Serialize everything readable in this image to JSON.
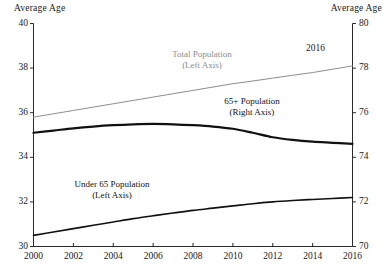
{
  "chart_data": {
    "type": "line",
    "title": "",
    "subtitle": "",
    "xlabel": "",
    "ylabel": "Average Age",
    "y2label": "Average Age",
    "grid": false,
    "legend_position": "inline-annotations",
    "x": [
      2000,
      2001,
      2002,
      2003,
      2004,
      2005,
      2006,
      2007,
      2008,
      2009,
      2010,
      2011,
      2012,
      2013,
      2014,
      2015,
      2016
    ],
    "xlim": [
      2000,
      2016
    ],
    "xticks": [
      2000,
      2002,
      2004,
      2006,
      2008,
      2010,
      2012,
      2014,
      2016
    ],
    "xticklabels": [
      "2000",
      "2002",
      "2004",
      "2006",
      "2008",
      "2010",
      "2012",
      "2014",
      "2016"
    ],
    "ylim": [
      30,
      40
    ],
    "yticks": [
      30,
      32,
      34,
      36,
      38,
      40
    ],
    "yticklabels": [
      "30",
      "32",
      "34",
      "36",
      "38",
      "40"
    ],
    "y2lim": [
      70,
      80
    ],
    "y2ticks": [
      70,
      72,
      74,
      76,
      78,
      80
    ],
    "y2ticklabels": [
      "70",
      "72",
      "74",
      "76",
      "78",
      "80"
    ],
    "series": [
      {
        "name": "Total Population",
        "axis": "left",
        "color": "#8d8d8d",
        "linewidth": 1.0,
        "label_line1": "Total Population",
        "label_line2": "(Left Axis)",
        "values": [
          35.8,
          35.95,
          36.1,
          36.25,
          36.4,
          36.55,
          36.7,
          36.85,
          37.0,
          37.15,
          37.3,
          37.42,
          37.55,
          37.68,
          37.8,
          37.95,
          38.1
        ]
      },
      {
        "name": "65+ Population",
        "axis": "right",
        "color": "#111111",
        "linewidth": 2.2,
        "label_line1": "65+ Population",
        "label_line2": "(Right Axis)",
        "values": [
          75.1,
          75.2,
          75.3,
          75.38,
          75.44,
          75.48,
          75.5,
          75.48,
          75.44,
          75.38,
          75.28,
          75.1,
          74.9,
          74.78,
          74.7,
          74.65,
          74.6
        ]
      },
      {
        "name": "Under 65 Population",
        "axis": "left",
        "color": "#111111",
        "linewidth": 1.6,
        "label_line1": "Under 65 Population",
        "label_line2": "(Left Axis)",
        "values": [
          30.5,
          30.65,
          30.8,
          30.95,
          31.1,
          31.25,
          31.38,
          31.5,
          31.62,
          31.72,
          31.82,
          31.92,
          32.0,
          32.06,
          32.11,
          32.15,
          32.2
        ]
      }
    ],
    "annotations": [
      {
        "text": "2016",
        "x": 2016,
        "series": "Total Population"
      }
    ]
  },
  "axes": {
    "left_title": "Average Age",
    "right_title": "Average Age"
  },
  "colors": {
    "total_population": "#8d8d8d",
    "sixtyfive_plus": "#111111",
    "under_65": "#111111",
    "axis": "#2a2a2a",
    "background": "#ffffff"
  }
}
